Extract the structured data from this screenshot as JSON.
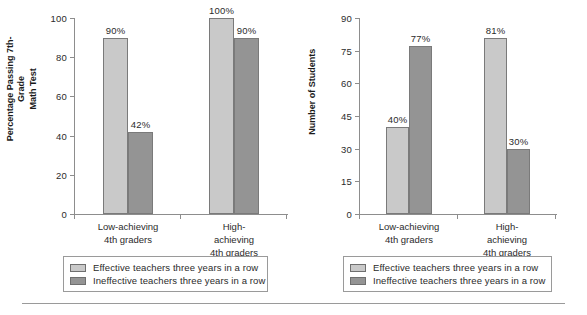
{
  "figure": {
    "panels": [
      {
        "id": "left",
        "y_title": "Percentage Passing 7th-Grade\nMath Test",
        "y_ticks": [
          "0",
          "20",
          "40",
          "60",
          "80",
          "100"
        ],
        "categories": [
          "Low-achieving\n4th graders",
          "High-achieving\n4th graders"
        ],
        "values": [
          {
            "group": "Low-achieving 4th graders",
            "series": "Effective teachers three years in a row",
            "value": 90,
            "label": "90%"
          },
          {
            "group": "Low-achieving 4th graders",
            "series": "Ineffective teachers three years in a row",
            "value": 42,
            "label": "42%"
          },
          {
            "group": "High-achieving 4th graders",
            "series": "Effective teachers three years in a row",
            "value": 100,
            "label": "100%"
          },
          {
            "group": "High-achieving 4th graders",
            "series": "Ineffective teachers three years in a row",
            "value": 90,
            "label": "90%"
          }
        ]
      },
      {
        "id": "right",
        "y_title": "Number of Students",
        "y_ticks": [
          "0",
          "15",
          "30",
          "45",
          "60",
          "75",
          "90"
        ],
        "categories": [
          "Low-achieving\n4th graders",
          "High-achieving\n4th graders"
        ],
        "values": [
          {
            "group": "Low-achieving 4th graders",
            "series": "Effective teachers three years in a row",
            "value": 40,
            "label": "40%"
          },
          {
            "group": "Low-achieving 4th graders",
            "series": "Ineffective teachers three years in a row",
            "value": 77,
            "label": "77%"
          },
          {
            "group": "High-achieving 4th graders",
            "series": "Effective teachers three years in a row",
            "value": 81,
            "label": "81%"
          },
          {
            "group": "High-achieving 4th graders",
            "series": "Ineffective teachers three years in a row",
            "value": 30,
            "label": "30%"
          }
        ]
      }
    ],
    "legend": {
      "light_label": "Effective teachers three years in a row",
      "dark_label": "Ineffective teachers three years in a row"
    },
    "colors": {
      "light_bar": "#c9c9c9",
      "dark_bar": "#949494",
      "bar_border": "#7a7a7a",
      "axis": "#8d8d8d",
      "text": "#2b2b2b"
    }
  },
  "chart_data": [
    {
      "type": "bar",
      "title": "",
      "xlabel": "",
      "ylabel": "Percentage Passing 7th-Grade Math Test",
      "ylim": [
        0,
        100
      ],
      "yticks": [
        0,
        20,
        40,
        60,
        80,
        100
      ],
      "grid": false,
      "legend_position": "below-plot",
      "categories": [
        "Low-achieving 4th graders",
        "High-achieving 4th graders"
      ],
      "series": [
        {
          "name": "Effective teachers three years in a row",
          "values": [
            90,
            100
          ],
          "labels": [
            "90%",
            "100%"
          ],
          "color": "#c9c9c9"
        },
        {
          "name": "Ineffective teachers three years in a row",
          "values": [
            42,
            90
          ],
          "labels": [
            "42%",
            "90%"
          ],
          "color": "#949494"
        }
      ]
    },
    {
      "type": "bar",
      "title": "",
      "xlabel": "",
      "ylabel": "Number of Students",
      "ylim": [
        0,
        90
      ],
      "yticks": [
        0,
        15,
        30,
        45,
        60,
        75,
        90
      ],
      "grid": false,
      "legend_position": "below-plot",
      "categories": [
        "Low-achieving 4th graders",
        "High-achieving 4th graders"
      ],
      "series": [
        {
          "name": "Effective teachers three years in a row",
          "values": [
            40,
            81
          ],
          "labels": [
            "40%",
            "81%"
          ],
          "color": "#c9c9c9"
        },
        {
          "name": "Ineffective teachers three years in a row",
          "values": [
            77,
            30
          ],
          "labels": [
            "77%",
            "30%"
          ],
          "color": "#949494"
        }
      ]
    }
  ]
}
